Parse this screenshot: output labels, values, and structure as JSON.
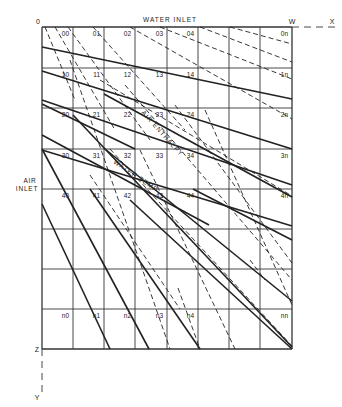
{
  "labels": {
    "origin": "0",
    "water_inlet": "WATER INLET",
    "w": "W",
    "x": "X",
    "air_inlet_line1": "AIR",
    "air_inlet_line2": "INLET",
    "z": "Z",
    "y": "Y",
    "air_enthalpy": "AIR ENTHALPY",
    "water_temp": "WATER TEMP"
  },
  "grid": {
    "columns_x": [
      42,
      73,
      104,
      135,
      167,
      198,
      229,
      260,
      292
    ],
    "rows_y": [
      27,
      68,
      108,
      149,
      189,
      229,
      269,
      309,
      349
    ],
    "cells": [
      {
        "label": "00",
        "col": 0,
        "row": 0
      },
      {
        "label": "01",
        "col": 1,
        "row": 0
      },
      {
        "label": "02",
        "col": 2,
        "row": 0
      },
      {
        "label": "03",
        "col": 3,
        "row": 0
      },
      {
        "label": "04",
        "col": 4,
        "row": 0
      },
      {
        "label": "0n",
        "col": 7,
        "row": 0
      },
      {
        "label": "10",
        "col": 0,
        "row": 1
      },
      {
        "label": "11",
        "col": 1,
        "row": 1
      },
      {
        "label": "12",
        "col": 2,
        "row": 1
      },
      {
        "label": "13",
        "col": 3,
        "row": 1
      },
      {
        "label": "14",
        "col": 4,
        "row": 1
      },
      {
        "label": "1n",
        "col": 7,
        "row": 1
      },
      {
        "label": "20",
        "col": 0,
        "row": 2
      },
      {
        "label": "21",
        "col": 1,
        "row": 2
      },
      {
        "label": "22",
        "col": 2,
        "row": 2
      },
      {
        "label": "23",
        "col": 3,
        "row": 2
      },
      {
        "label": "24",
        "col": 4,
        "row": 2
      },
      {
        "label": "2n",
        "col": 7,
        "row": 2
      },
      {
        "label": "30",
        "col": 0,
        "row": 3
      },
      {
        "label": "31",
        "col": 1,
        "row": 3
      },
      {
        "label": "32",
        "col": 2,
        "row": 3
      },
      {
        "label": "33",
        "col": 3,
        "row": 3
      },
      {
        "label": "34",
        "col": 4,
        "row": 3
      },
      {
        "label": "3n",
        "col": 7,
        "row": 3
      },
      {
        "label": "40",
        "col": 0,
        "row": 4
      },
      {
        "label": "41",
        "col": 1,
        "row": 4
      },
      {
        "label": "42",
        "col": 2,
        "row": 4
      },
      {
        "label": "43",
        "col": 3,
        "row": 4
      },
      {
        "label": "44",
        "col": 4,
        "row": 4
      },
      {
        "label": "4n",
        "col": 7,
        "row": 4
      },
      {
        "label": "n0",
        "col": 0,
        "row": 7
      },
      {
        "label": "n1",
        "col": 1,
        "row": 7
      },
      {
        "label": "n2",
        "col": 2,
        "row": 7
      },
      {
        "label": "n3",
        "col": 3,
        "row": 7
      },
      {
        "label": "n4",
        "col": 4,
        "row": 7
      },
      {
        "label": "nn",
        "col": 7,
        "row": 7
      }
    ]
  },
  "solid_lines": [
    [
      [
        42,
        47
      ],
      [
        292,
        99
      ]
    ],
    [
      [
        42,
        71
      ],
      [
        292,
        149
      ]
    ],
    [
      [
        42,
        100
      ],
      [
        292,
        185
      ]
    ],
    [
      [
        42,
        150
      ],
      [
        292,
        226
      ]
    ],
    [
      [
        42,
        135
      ],
      [
        209,
        225
      ]
    ],
    [
      [
        42,
        104
      ],
      [
        135,
        149
      ]
    ],
    [
      [
        42,
        149
      ],
      [
        149,
        349
      ]
    ],
    [
      [
        42,
        204
      ],
      [
        110,
        349
      ]
    ],
    [
      [
        90,
        189
      ],
      [
        200,
        349
      ]
    ],
    [
      [
        105,
        149
      ],
      [
        292,
        301
      ]
    ],
    [
      [
        130,
        200
      ],
      [
        292,
        349
      ]
    ],
    [
      [
        193,
        189
      ],
      [
        292,
        240
      ]
    ],
    [
      [
        104,
        94
      ],
      [
        292,
        197
      ]
    ],
    [
      [
        73,
        115
      ],
      [
        292,
        347
      ]
    ]
  ],
  "dashed_lines": [
    [
      [
        45,
        27
      ],
      [
        75,
        100
      ]
    ],
    [
      [
        55,
        27
      ],
      [
        115,
        130
      ]
    ],
    [
      [
        68,
        27
      ],
      [
        150,
        140
      ]
    ],
    [
      [
        93,
        27
      ],
      [
        185,
        130
      ]
    ],
    [
      [
        130,
        27
      ],
      [
        292,
        119
      ]
    ],
    [
      [
        160,
        27
      ],
      [
        292,
        79
      ]
    ],
    [
      [
        200,
        27
      ],
      [
        292,
        62
      ]
    ],
    [
      [
        230,
        27
      ],
      [
        292,
        44
      ]
    ],
    [
      [
        70,
        60
      ],
      [
        170,
        349
      ]
    ],
    [
      [
        140,
        150
      ],
      [
        235,
        349
      ]
    ],
    [
      [
        178,
        288
      ],
      [
        200,
        349
      ]
    ],
    [
      [
        100,
        80
      ],
      [
        292,
        196
      ]
    ],
    [
      [
        125,
        85
      ],
      [
        292,
        280
      ]
    ],
    [
      [
        175,
        105
      ],
      [
        292,
        263
      ]
    ],
    [
      [
        205,
        110
      ],
      [
        292,
        305
      ]
    ],
    [
      [
        90,
        175
      ],
      [
        180,
        309
      ]
    ],
    [
      [
        110,
        149
      ],
      [
        292,
        346
      ]
    ],
    [
      [
        250,
        260
      ],
      [
        265,
        280
      ]
    ]
  ],
  "axes": {
    "x_dash": [
      [
        292,
        27
      ],
      [
        335,
        27
      ]
    ],
    "y_dash": [
      [
        42,
        349
      ],
      [
        42,
        395
      ]
    ]
  },
  "colors": {
    "line": "#222222",
    "grid": "#333333",
    "background": "#ffffff"
  }
}
